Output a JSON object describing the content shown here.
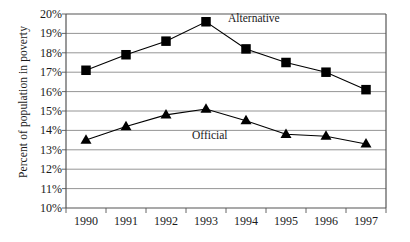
{
  "chart_data": {
    "type": "line",
    "title": "",
    "xlabel": "",
    "ylabel": "Percent of population in poverty",
    "categories": [
      "1990",
      "1991",
      "1992",
      "1993",
      "1994",
      "1995",
      "1996",
      "1997"
    ],
    "ylim": [
      10,
      20
    ],
    "ytick_labels": [
      "20%",
      "19%",
      "18%",
      "17%",
      "16%",
      "15%",
      "14%",
      "13%",
      "12%",
      "11%",
      "10%"
    ],
    "ytick_values": [
      20,
      19,
      18,
      17,
      16,
      15,
      14,
      13,
      12,
      11,
      10
    ],
    "grid": true,
    "legend": "inline-annotations",
    "series": [
      {
        "name": "Alternative",
        "marker": "square",
        "color": "#000000",
        "values": [
          17.1,
          17.9,
          18.6,
          19.6,
          18.2,
          17.5,
          17.0,
          16.1
        ],
        "label_x": "1993",
        "label_offset": "right"
      },
      {
        "name": "Official",
        "marker": "triangle",
        "color": "#000000",
        "values": [
          13.5,
          14.2,
          14.8,
          15.1,
          14.5,
          13.8,
          13.7,
          13.3
        ],
        "label_x": "1993",
        "label_offset": "below"
      }
    ],
    "annotations": [
      {
        "text": "Alternative",
        "x_px": 228,
        "y_px": 18
      },
      {
        "text": "Official",
        "x_px": 192,
        "y_px": 135
      }
    ],
    "axis_color": "#555555",
    "grid_color": "#7a7a7a",
    "plot_bg": "#ffffff"
  }
}
